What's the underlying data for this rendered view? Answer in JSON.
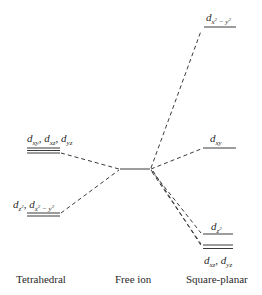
{
  "diagram": {
    "type": "crystal-field-splitting",
    "columns": [
      {
        "id": "tetrahedral",
        "caption": "Tetrahedral"
      },
      {
        "id": "free-ion",
        "caption": "Free ion"
      },
      {
        "id": "square-planar",
        "caption": "Square-planar"
      }
    ],
    "tetrahedral": {
      "upper": {
        "label_main": "d",
        "orbitals": [
          "xy",
          "xz",
          "yz"
        ],
        "degeneracy": 3
      },
      "lower": {
        "label_main": "d",
        "orbitals": [
          "z²",
          "x² − y²"
        ],
        "degeneracy": 2
      }
    },
    "free_ion": {
      "degeneracy": 5
    },
    "square_planar": {
      "levels": [
        {
          "orbital": "x² − y²",
          "degeneracy": 1
        },
        {
          "orbital": "xy",
          "degeneracy": 1
        },
        {
          "orbital": "z²",
          "degeneracy": 1
        },
        {
          "orbital": "xz, yz",
          "degeneracy": 2
        }
      ]
    },
    "line_color": "#3a3a3a"
  }
}
